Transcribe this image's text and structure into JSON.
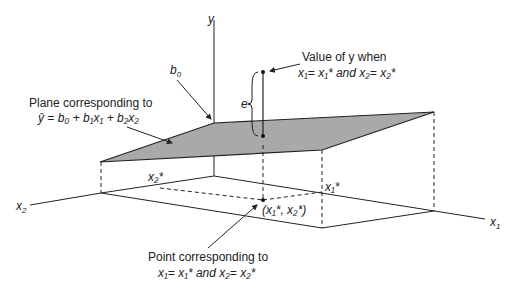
{
  "diagram": {
    "axes": {
      "y": "y",
      "x1": "x",
      "x1_sub": "1",
      "x2": "x",
      "x2_sub": "2"
    },
    "labels": {
      "b0": "b",
      "b0_sub": "0",
      "e": "e",
      "value_line1": "Value of y when",
      "value_line2": "x₁= x₁*  and x₂= x₂*",
      "plane_line1": "Plane corresponding to",
      "plane_line2": "ŷ = b₀ + b₁x₁ + b₂x₂",
      "x2_star": "x₂*",
      "x1_star": "x₁*",
      "point_coord": "(x₁*, x₂*)",
      "point_line1": "Point corresponding to",
      "point_line2": "x₁= x₁*  and x₂= x₂*"
    },
    "colors": {
      "plane": "#a9a9a9",
      "line": "#222222"
    }
  }
}
